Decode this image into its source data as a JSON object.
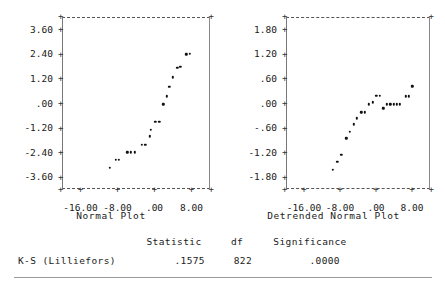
{
  "chart_data": [
    {
      "type": "scatter",
      "title": "Normal Plot",
      "xlabel": "Normal Plot",
      "ylabel": "",
      "xlim": [
        -20.0,
        12.0
      ],
      "ylim": [
        -4.2,
        4.2
      ],
      "grid": false,
      "legend": null,
      "xticks": [
        "-16.00",
        "-8.00",
        ".00",
        "8.00"
      ],
      "xtick_values": [
        -16.0,
        -8.0,
        0.0,
        8.0
      ],
      "yticks": [
        "3.60",
        "2.40",
        "1.20",
        ".00",
        "-1.20",
        "-2.40",
        "-3.60"
      ],
      "ytick_values": [
        3.6,
        2.4,
        1.2,
        0.0,
        -1.2,
        -2.4,
        -3.6
      ],
      "points": [
        [
          -9.6,
          -3.15
        ],
        [
          -8.4,
          -2.78
        ],
        [
          -7.7,
          -2.76
        ],
        [
          -5.9,
          -2.4
        ],
        [
          -5.1,
          -2.4
        ],
        [
          -4.3,
          -2.4
        ],
        [
          -2.7,
          -2.05
        ],
        [
          -2.0,
          -2.05
        ],
        [
          -1.0,
          -1.62
        ],
        [
          -0.8,
          -1.32
        ],
        [
          0.2,
          -0.92
        ],
        [
          1.0,
          -0.92
        ],
        [
          1.9,
          -0.07
        ],
        [
          2.6,
          0.33
        ],
        [
          3.2,
          0.8
        ],
        [
          4.0,
          1.25
        ],
        [
          4.9,
          1.72
        ],
        [
          5.6,
          1.78
        ],
        [
          6.9,
          2.38
        ],
        [
          7.6,
          2.4
        ]
      ]
    },
    {
      "type": "scatter",
      "title": "Detrended Normal Plot",
      "xlabel": "Detrended Normal Plot",
      "ylabel": "",
      "xlim": [
        -20.0,
        12.0
      ],
      "ylim": [
        -2.1,
        2.1
      ],
      "grid": false,
      "legend": null,
      "xticks": [
        "-16.00",
        "-8.00",
        ".00",
        "8.00"
      ],
      "xtick_values": [
        -16.0,
        -8.0,
        0.0,
        8.0
      ],
      "yticks": [
        "1.80",
        "1.20",
        ".60",
        ".00",
        "-.60",
        "-1.20",
        "-1.80"
      ],
      "ytick_values": [
        1.8,
        1.2,
        0.6,
        0.0,
        -0.6,
        -1.2,
        -1.8
      ],
      "points": [
        [
          -9.6,
          -1.63
        ],
        [
          -8.6,
          -1.44
        ],
        [
          -7.7,
          -1.27
        ],
        [
          -6.6,
          -0.86
        ],
        [
          -5.8,
          -0.7
        ],
        [
          -5.0,
          -0.52
        ],
        [
          -4.2,
          -0.37
        ],
        [
          -3.3,
          -0.23
        ],
        [
          -2.5,
          -0.23
        ],
        [
          -1.6,
          -0.03
        ],
        [
          -0.7,
          0.02
        ],
        [
          0.1,
          0.17
        ],
        [
          0.9,
          0.17
        ],
        [
          1.6,
          -0.13
        ],
        [
          2.4,
          -0.03
        ],
        [
          3.2,
          -0.03
        ],
        [
          3.9,
          -0.03
        ],
        [
          4.6,
          -0.03
        ],
        [
          5.3,
          -0.03
        ],
        [
          6.6,
          0.16
        ],
        [
          7.3,
          0.16
        ],
        [
          8.1,
          0.41
        ]
      ]
    }
  ],
  "table": {
    "headers": {
      "name": "",
      "statistic": "Statistic",
      "df": "df",
      "significance": "Significance"
    },
    "rows": [
      {
        "name": "K-S (Lilliefors)",
        "statistic": ".1575",
        "df": "822",
        "significance": ".0000"
      }
    ]
  },
  "style": {
    "dot_color": "#111111",
    "axis_color": "#555555",
    "text_color": "#1a1a1a"
  }
}
